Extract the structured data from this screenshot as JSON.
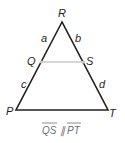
{
  "diagram": {
    "vertices": {
      "R": "R",
      "Q": "Q",
      "S": "S",
      "P": "P",
      "T": "T"
    },
    "segments": {
      "a": "a",
      "b": "b",
      "c": "c",
      "d": "d"
    },
    "caption": {
      "seg1": "QS",
      "parallel": "∥",
      "seg2": "PT"
    },
    "colors": {
      "stroke": "#231f20",
      "midline": "#c8c8c8",
      "caption": "#6d6e71"
    }
  }
}
